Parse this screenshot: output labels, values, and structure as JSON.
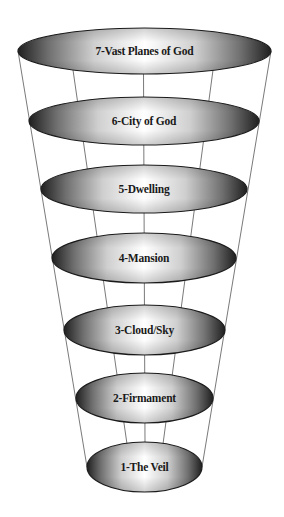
{
  "diagram": {
    "type": "funnel-of-heavens",
    "title": "",
    "colors": {
      "background": "#ffffff",
      "ellipse_edge": "#1c1c1c",
      "ellipse_dark": "#2a2a2a",
      "ellipse_light": "#ffffff",
      "connector_lines": "#6a6a6a",
      "label": "#1a1a1a"
    },
    "layers": [
      {
        "level": 7,
        "label": "7-Vast Planes of God",
        "cx": 144.5,
        "cy": 51,
        "rx": 126.5,
        "ry": 23
      },
      {
        "level": 6,
        "label": "6-City of God",
        "cx": 144,
        "cy": 121,
        "rx": 115,
        "ry": 24
      },
      {
        "level": 5,
        "label": "5-Dwelling",
        "cx": 144,
        "cy": 189,
        "rx": 103,
        "ry": 24
      },
      {
        "level": 4,
        "label": "4-Mansion",
        "cx": 144,
        "cy": 258,
        "rx": 92,
        "ry": 25
      },
      {
        "level": 3,
        "label": "3-Cloud/Sky",
        "cx": 144.5,
        "cy": 330,
        "rx": 80.5,
        "ry": 25
      },
      {
        "level": 2,
        "label": "2-Firmament",
        "cx": 144.5,
        "cy": 398,
        "rx": 68.5,
        "ry": 25
      },
      {
        "level": 1,
        "label": "1-The Veil",
        "cx": 144.5,
        "cy": 467,
        "rx": 57.5,
        "ry": 25
      }
    ]
  }
}
